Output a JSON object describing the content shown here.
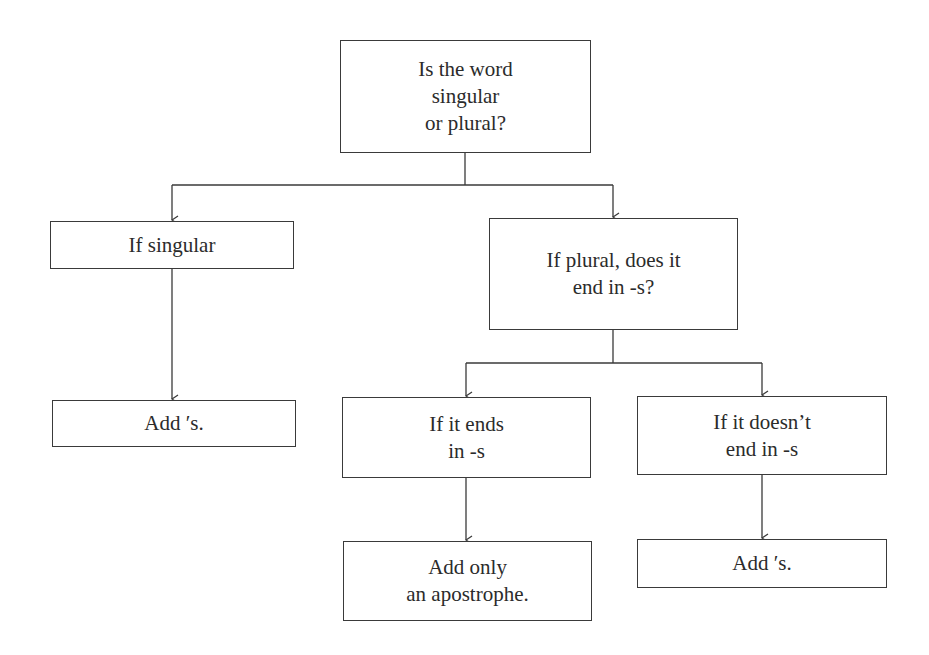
{
  "diagram": {
    "type": "flowchart",
    "colors": {
      "line": "#3a3a3a",
      "text": "#2b2b2b",
      "background": "#ffffff"
    },
    "nodes": {
      "root": {
        "lines": [
          "Is the word",
          "singular",
          "or plural?"
        ]
      },
      "singular": {
        "lines": [
          "If singular"
        ]
      },
      "plural": {
        "lines": [
          "If plural, does it",
          "end in -s?"
        ]
      },
      "singular_result": {
        "lines": [
          "Add ′s."
        ]
      },
      "ends_in_s": {
        "lines": [
          "If it ends",
          "in -s"
        ]
      },
      "not_ends_in_s": {
        "lines": [
          "If it doesn’t",
          "end in -s"
        ]
      },
      "ends_in_s_result": {
        "lines": [
          "Add only",
          "an apostrophe."
        ]
      },
      "not_ends_in_s_result": {
        "lines": [
          "Add ′s."
        ]
      }
    },
    "edges": [
      {
        "from": "root",
        "to": "singular"
      },
      {
        "from": "root",
        "to": "plural"
      },
      {
        "from": "singular",
        "to": "singular_result"
      },
      {
        "from": "plural",
        "to": "ends_in_s"
      },
      {
        "from": "plural",
        "to": "not_ends_in_s"
      },
      {
        "from": "ends_in_s",
        "to": "ends_in_s_result"
      },
      {
        "from": "not_ends_in_s",
        "to": "not_ends_in_s_result"
      }
    ]
  }
}
